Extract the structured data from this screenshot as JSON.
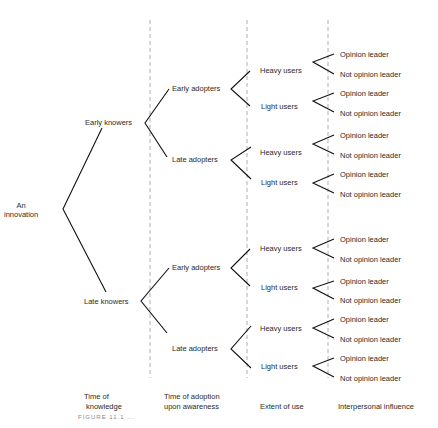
{
  "diagram": {
    "root": {
      "label_line1": "An",
      "label_line2": "innovation"
    },
    "level1": [
      "Early knowers",
      "Late knowers"
    ],
    "level2": [
      "Early adopters",
      "Late adopters",
      "Early adopters",
      "Late adopters"
    ],
    "level3": [
      "Heavy users",
      "Light users",
      "Heavy users",
      "Light users",
      "Heavy users",
      "Light users",
      "Heavy users",
      "Light users"
    ],
    "level4": [
      "Opinion leader",
      "Not opinion leader",
      "Opinion leader",
      "Not opinion leader",
      "Opinion leader",
      "Not opinion leader",
      "Opinion leader",
      "Not opinion leader",
      "Opinion leader",
      "Not opinion leader",
      "Opinion leader",
      "Not opinion leader",
      "Opinion leader",
      "Not opinion leader",
      "Opinion leader",
      "Not opinion leader"
    ]
  },
  "axis_labels": {
    "col1_line1": "Time of",
    "col1_line2": "knowledge",
    "col2_line1": "Time of adoption",
    "col2_line2": "upon awareness",
    "col3": "Extent of use",
    "col4": "Interpersonal influence"
  },
  "caption": "FIGURE 11.1 ..."
}
